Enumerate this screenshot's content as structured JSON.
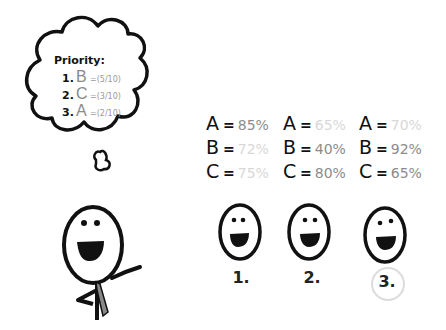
{
  "thought": {
    "title": "Priority:",
    "items": [
      {
        "num": "1.",
        "letter": "B",
        "score": "=(5/10)"
      },
      {
        "num": "2.",
        "letter": "C",
        "score": "=(3/10)"
      },
      {
        "num": "3.",
        "letter": "A",
        "score": "=(2/10)"
      }
    ]
  },
  "options": [
    {
      "label": "1.",
      "values": [
        {
          "letter": "A",
          "eq": "=",
          "val": "85%",
          "color": "#8c8c8c"
        },
        {
          "letter": "B",
          "eq": "=",
          "val": "72%",
          "color": "#d8d8d8"
        },
        {
          "letter": "C",
          "eq": "=",
          "val": "75%",
          "color": "#d8d8d8"
        }
      ]
    },
    {
      "label": "2.",
      "values": [
        {
          "letter": "A",
          "eq": "=",
          "val": "65%",
          "color": "#d8d8d8"
        },
        {
          "letter": "B",
          "eq": "=",
          "val": "40%",
          "color": "#8c8c8c"
        },
        {
          "letter": "C",
          "eq": "=",
          "val": "80%",
          "color": "#8c8c8c"
        }
      ]
    },
    {
      "label": "3.",
      "values": [
        {
          "letter": "A",
          "eq": "=",
          "val": "70%",
          "color": "#d8d8d8"
        },
        {
          "letter": "B",
          "eq": "=",
          "val": "92%",
          "color": "#8c8c8c"
        },
        {
          "letter": "C",
          "eq": "=",
          "val": "65%",
          "color": "#8c8c8c"
        }
      ]
    }
  ],
  "highlight": "3."
}
